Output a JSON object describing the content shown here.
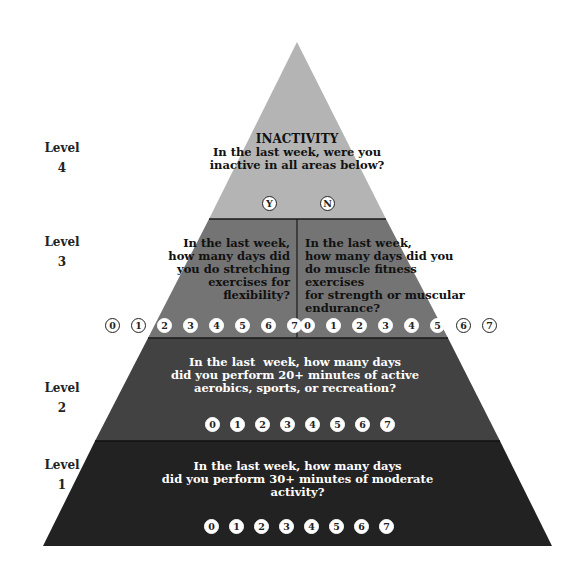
{
  "diagram": {
    "type": "pyramid",
    "colors": {
      "level4": "#b4b4b4",
      "level3": "#747474",
      "level2": "#424242",
      "level1": "#222222",
      "background": "#ffffff"
    },
    "levels": [
      {
        "label": "Level",
        "number": "4",
        "title": "INACTIVITY",
        "question_lines": [
          "In the last week, were you",
          "inactive in all areas below?"
        ],
        "options": [
          "Y",
          "N"
        ]
      },
      {
        "label": "Level",
        "number": "3",
        "left": {
          "question_lines": [
            "In the last week,",
            "how many days did",
            "you do stretching",
            "exercises for flexibility?"
          ]
        },
        "right": {
          "question_lines": [
            "In the last week,",
            "how many days did you",
            "do muscle fitness exercises",
            "for strength or muscular",
            "endurance?"
          ]
        },
        "left_options": [
          "0",
          "1",
          "2",
          "3",
          "4",
          "5",
          "6",
          "7"
        ],
        "right_options": [
          "0",
          "1",
          "2",
          "3",
          "4",
          "5",
          "6",
          "7"
        ]
      },
      {
        "label": "Level",
        "number": "2",
        "question_lines": [
          "In the last  week, how many days",
          "did you perform 20+ minutes of active",
          "aerobics, sports, or recreation?"
        ],
        "options": [
          "0",
          "1",
          "2",
          "3",
          "4",
          "5",
          "6",
          "7"
        ]
      },
      {
        "label": "Level",
        "number": "1",
        "question_lines": [
          "In the last week, how many days",
          "did you perform 30+ minutes of moderate activity?"
        ],
        "options": [
          "0",
          "1",
          "2",
          "3",
          "4",
          "5",
          "6",
          "7"
        ]
      }
    ]
  }
}
